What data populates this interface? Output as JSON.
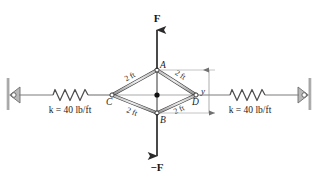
{
  "figure": {
    "background_color": "#ffffff",
    "line_color": "#6e6e6e",
    "member_color": "#8c8c8c",
    "member_edge_color": "#3c3c3c",
    "force_color": "#2a2a2a",
    "dim_color": "#909090",
    "forces": {
      "top_label": "F",
      "bottom_label": "−F"
    },
    "nodes": {
      "top_label": "A",
      "bottom_label": "B",
      "left_label": "C",
      "right_label": "D"
    },
    "members": [
      {
        "id": "CA",
        "label": "2 ft"
      },
      {
        "id": "AD",
        "label": "2 ft"
      },
      {
        "id": "CB",
        "label": "2 ft"
      },
      {
        "id": "BD",
        "label": "2 ft"
      }
    ],
    "dimension": {
      "label": "y"
    },
    "springs": [
      {
        "id": "left-spring",
        "label": "k = 40 lb/ft",
        "stiffness": "40",
        "units": "lb/ft"
      },
      {
        "id": "right-spring",
        "label": "k = 40 lb/ft",
        "stiffness": "40",
        "units": "lb/ft"
      }
    ]
  }
}
